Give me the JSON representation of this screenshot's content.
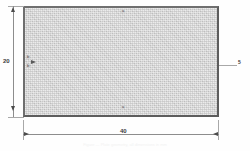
{
  "drawing": {
    "title": "Rectangular plate dimensioned drawing",
    "part": {
      "name": "rectangular-plate",
      "fill_color": "#d2d2d2",
      "edge_color": "#5d5d5d"
    },
    "dimensions": {
      "height": {
        "label": "20",
        "orientation": "vertical",
        "position": "left"
      },
      "width": {
        "label": "40",
        "orientation": "horizontal",
        "position": "bottom"
      },
      "right_edge": {
        "label": "5",
        "orientation": "vertical",
        "position": "right"
      }
    },
    "annotations": {
      "top_center": "a",
      "bottom_center": "a",
      "left_upper": "b",
      "left_lower": "b"
    },
    "caption": "Figure — Plate geometry, all dimensions in mm",
    "units": "mm",
    "line_color": "#8d8d8d",
    "arrow_color": "#4b4b4b"
  }
}
